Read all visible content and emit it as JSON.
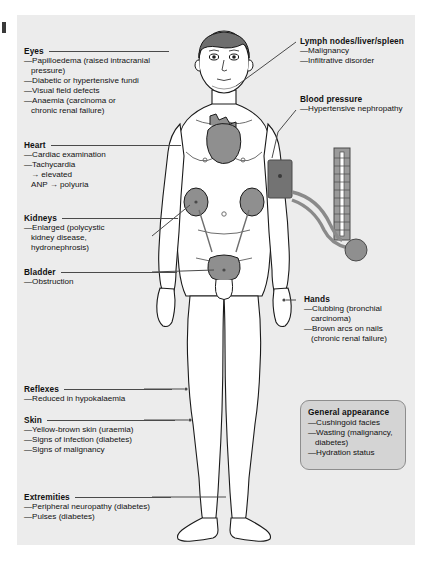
{
  "panel": {
    "background": "#ececec"
  },
  "figure": {
    "organs": [
      "heart",
      "kidneys",
      "bladder"
    ],
    "device": "sphygmomanometer-cuff-and-manometer"
  },
  "colors": {
    "panel_bg": "#ececec",
    "organ_fill": "#8f8f8f",
    "hair": "#6e6e6e",
    "cuff": "#737373",
    "box_fill": "#d4d4d4",
    "leader_line": "#4a4a4a",
    "text": "#111111"
  },
  "sections": {
    "eyes": {
      "title": "Eyes",
      "items": [
        "—Papilloedema (raised intracranial",
        "pressure)",
        "—Diabetic or hypertensive fundi",
        "—Visual field defects",
        "—Anaemia (carcinoma or",
        "chronic renal failure)"
      ]
    },
    "heart": {
      "title": "Heart",
      "items": [
        "—Cardiac examination",
        "—Tachycardia",
        "→ elevated",
        "ANP → polyuria"
      ]
    },
    "kidneys": {
      "title": "Kidneys",
      "items": [
        "—Enlarged (polycystic",
        "kidney disease,",
        "hydronephrosis)"
      ]
    },
    "bladder": {
      "title": "Bladder",
      "items": [
        "—Obstruction"
      ]
    },
    "reflexes": {
      "title": "Reflexes",
      "items": [
        "—Reduced in hypokalaemia"
      ]
    },
    "skin": {
      "title": "Skin",
      "items": [
        "—Yellow-brown skin (uraemia)",
        "—Signs of infection (diabetes)",
        "—Signs of malignancy"
      ]
    },
    "extremities": {
      "title": "Extremities",
      "items": [
        "—Peripheral neuropathy (diabetes)",
        "—Pulses (diabetes)"
      ]
    },
    "lymph": {
      "title": "Lymph nodes/liver/spleen",
      "items": [
        "—Malignancy",
        "—Infiltrative disorder"
      ]
    },
    "blood_pressure": {
      "title": "Blood pressure",
      "items": [
        "—Hypertensive nephropathy"
      ]
    },
    "hands": {
      "title": "Hands",
      "items": [
        "—Clubbing (bronchial",
        "carcinoma)",
        "—Brown arcs on nails",
        "(chronic renal failure)"
      ]
    },
    "general_appearance": {
      "title": "General appearance",
      "items": [
        "—Cushingoid facies",
        "—Wasting (malignancy,",
        "diabetes)",
        "—Hydration status"
      ]
    }
  }
}
